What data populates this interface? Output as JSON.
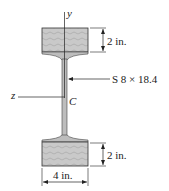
{
  "figure": {
    "axes": {
      "y_label": "y",
      "z_label": "z",
      "centroid_label": "C"
    },
    "section_label": "S 8 × 18.4",
    "dimensions": {
      "top_block_height": "2 in.",
      "bottom_block_height": "2 in.",
      "block_width": "4 in."
    },
    "colors": {
      "wood": "#c8c8c8",
      "steel": "#bdbdbd",
      "line": "#222222"
    }
  }
}
